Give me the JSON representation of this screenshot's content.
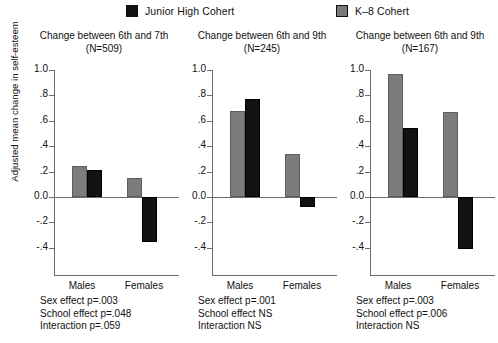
{
  "legend": {
    "entries": [
      {
        "label": "Junior High Cohert",
        "color": "#111111",
        "key": "junior-high"
      },
      {
        "label": "K–8 Cohert",
        "color": "#7a7a7a",
        "key": "k8"
      }
    ]
  },
  "axis": {
    "ylabel": "Adjusted mean change in self-esteem",
    "yticks": [
      "1.0",
      ".8",
      ".6",
      ".4",
      ".2",
      "0.0",
      "-.2",
      "-.4"
    ],
    "ytick_values": [
      1.0,
      0.8,
      0.6,
      0.4,
      0.2,
      0.0,
      -0.2,
      -0.4
    ],
    "ylim": [
      -0.55,
      1.1
    ],
    "categories": [
      "Males",
      "Females"
    ]
  },
  "panels": [
    {
      "title_line1": "Change between 6th and 7th",
      "title_line2": "(N=509)",
      "n": 509,
      "notes": [
        "Sex effect p=.003",
        "School effect p=.048",
        "Interaction p=.059"
      ],
      "values": {
        "k8_males": 0.245,
        "jh_males": 0.215,
        "k8_females": 0.15,
        "jh_females": -0.355
      }
    },
    {
      "title_line1": "Change between 6th and 9th",
      "title_line2": "(N=245)",
      "n": 245,
      "notes": [
        "Sex effect p=.001",
        "School effect NS",
        "Interaction NS"
      ],
      "values": {
        "k8_males": 0.68,
        "jh_males": 0.77,
        "k8_females": 0.335,
        "jh_females": -0.08
      }
    },
    {
      "title_line1": "Change between 6th and 9th",
      "title_line2": "(N=167)",
      "n": 167,
      "notes": [
        "Sex effect p=.003",
        "School effect p=.006",
        "Interaction NS"
      ],
      "values": {
        "k8_males": 0.97,
        "jh_males": 0.545,
        "k8_females": 0.67,
        "jh_females": -0.41
      }
    }
  ],
  "chart_data": {
    "type": "bar",
    "title": "",
    "xlabel": "",
    "ylabel": "Adjusted mean change in self-esteem",
    "ylim": [
      -0.55,
      1.1
    ],
    "yticks": [
      -0.4,
      -0.2,
      0.0,
      0.2,
      0.4,
      0.6,
      0.8,
      1.0
    ],
    "grid": false,
    "legend_position": "top",
    "categories": [
      "Males",
      "Females"
    ],
    "panels": [
      {
        "panel_title": "Change between 6th and 7th (N=509)",
        "series": [
          {
            "name": "K–8 Cohert",
            "color": "#7a7a7a",
            "values": [
              0.245,
              0.15
            ]
          },
          {
            "name": "Junior High Cohert",
            "color": "#111111",
            "values": [
              0.215,
              -0.355
            ]
          }
        ],
        "annotations": [
          "Sex effect p=.003",
          "School effect p=.048",
          "Interaction p=.059"
        ]
      },
      {
        "panel_title": "Change between 6th and 9th (N=245)",
        "series": [
          {
            "name": "K–8 Cohert",
            "color": "#7a7a7a",
            "values": [
              0.68,
              0.335
            ]
          },
          {
            "name": "Junior High Cohert",
            "color": "#111111",
            "values": [
              0.77,
              -0.08
            ]
          }
        ],
        "annotations": [
          "Sex effect p=.001",
          "School effect NS",
          "Interaction NS"
        ]
      },
      {
        "panel_title": "Change between 6th and 9th (N=167)",
        "series": [
          {
            "name": "K–8 Cohert",
            "color": "#7a7a7a",
            "values": [
              0.97,
              0.67
            ]
          },
          {
            "name": "Junior High Cohert",
            "color": "#111111",
            "values": [
              0.545,
              -0.41
            ]
          }
        ],
        "annotations": [
          "Sex effect p=.003",
          "School effect p=.006",
          "Interaction NS"
        ]
      }
    ]
  }
}
